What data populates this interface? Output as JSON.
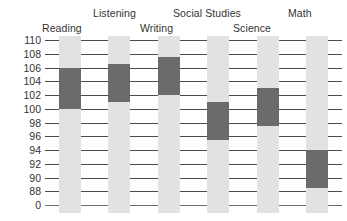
{
  "chart_data": {
    "type": "bar",
    "title": "",
    "subtitle": "",
    "xlabel": "",
    "ylabel": "",
    "categories": [
      "Reading",
      "Listening",
      "Writing",
      "Social Studies",
      "Science",
      "Math"
    ],
    "series": [
      {
        "name": "Score range",
        "low": [
          100,
          101,
          102,
          95.5,
          97.5,
          88.5
        ],
        "high": [
          106,
          106.5,
          107.5,
          101,
          103,
          94
        ]
      }
    ],
    "ytick_labels": [
      "110",
      "108",
      "106",
      "104",
      "102",
      "100",
      "98",
      "96",
      "94",
      "92",
      "90",
      "88",
      "0"
    ],
    "ytick_values": [
      110,
      108,
      106,
      104,
      102,
      100,
      98,
      96,
      94,
      92,
      90,
      88,
      86
    ],
    "ylim": [
      86,
      110
    ],
    "grid": true,
    "legend": "none",
    "bar_color": "#6b6b6b",
    "band_color": "#e2e2e2",
    "gridline_color": "#4a4a4a",
    "text_color": "#333333",
    "background": "#ffffff"
  },
  "labels": {
    "reading": "Reading",
    "listening": "Listening",
    "writing": "Writing",
    "social_studies": "Social Studies",
    "science": "Science",
    "math": "Math"
  }
}
